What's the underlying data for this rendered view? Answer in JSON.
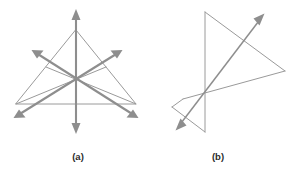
{
  "page": {
    "background_color": "#ffffff",
    "width": 292,
    "height": 173
  },
  "style": {
    "line_color": "#9a9a9a",
    "vector_color": "#8e8e8e",
    "caption_color": "#2b2b2b"
  },
  "figures": [
    {
      "id": "figure-a",
      "caption": "(a)",
      "caption_x": 78,
      "caption_y": 160,
      "description": "Equilateral triangle with three concurrent double-headed arrow vectors through the centroid",
      "outline": {
        "name": "triangle-outline",
        "points": "76,30 136,104 16,104"
      },
      "centroid": {
        "x": 76,
        "y": 79
      },
      "vectors": [
        {
          "name": "vector-vertical",
          "x1": 76,
          "y1": 11,
          "x2": 76,
          "y2": 132,
          "arrow_start": true,
          "arrow_end": true
        },
        {
          "name": "vector-up-right",
          "x1": 33,
          "y1": 51,
          "x2": 137,
          "y2": 117,
          "arrow_start": true,
          "arrow_end": true
        },
        {
          "name": "vector-up-left",
          "x1": 121,
          "y1": 51,
          "x2": 15,
          "y2": 117,
          "arrow_start": true,
          "arrow_end": true
        }
      ]
    },
    {
      "id": "figure-b",
      "caption": "(b)",
      "caption_x": 218,
      "caption_y": 160,
      "description": "Irregular polygon with crossing double-headed arrow vector",
      "outline": {
        "name": "polygon-outline",
        "points": "205,12 285,71 205,132 172,107 205,12"
      },
      "inner_segments": [
        {
          "name": "segment-top-to-right",
          "x1": 205,
          "y1": 12,
          "x2": 285,
          "y2": 71
        },
        {
          "name": "segment-right-to-lower",
          "x1": 285,
          "y1": 71,
          "x2": 183,
          "y2": 99
        },
        {
          "name": "segment-vertical",
          "x1": 205,
          "y1": 12,
          "x2": 205,
          "y2": 132
        },
        {
          "name": "segment-lower-left-wedge-top",
          "x1": 183,
          "y1": 99,
          "x2": 172,
          "y2": 107
        },
        {
          "name": "segment-lower-left-wedge-bottom",
          "x1": 172,
          "y1": 107,
          "x2": 205,
          "y2": 132
        }
      ],
      "vectors": [
        {
          "name": "vector-diagonal",
          "x1": 176,
          "y1": 130,
          "x2": 264,
          "y2": 14,
          "arrow_start": true,
          "arrow_end": true
        }
      ]
    }
  ]
}
